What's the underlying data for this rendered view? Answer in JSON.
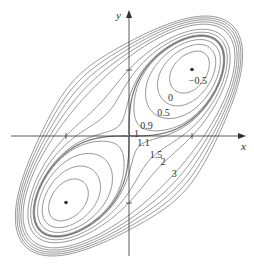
{
  "chart_data": {
    "type": "contour",
    "title": "",
    "function": "f(x,y) = x^4 + y^4 - 4xy + 1",
    "xlabel": "x",
    "ylabel": "y",
    "x_ticks": [
      {
        "value": -1,
        "label": ""
      },
      {
        "value": 1,
        "label": ""
      }
    ],
    "y_ticks": [
      {
        "value": -1,
        "label": ""
      },
      {
        "value": 1,
        "label": ""
      }
    ],
    "xlim": [
      -1.85,
      1.85
    ],
    "ylim": [
      -1.85,
      1.85
    ],
    "grid": false,
    "contour_levels": [
      -0.5,
      0,
      0.5,
      0.9,
      1,
      1.1,
      1.5,
      2,
      3
    ],
    "extra_unlabeled_levels": [
      3.5,
      4,
      4.5,
      5
    ],
    "level_labels": [
      {
        "text": "−0.5",
        "x": 0.95,
        "y": 0.78
      },
      {
        "text": "0",
        "x": 0.62,
        "y": 0.53
      },
      {
        "text": "0.5",
        "x": 0.45,
        "y": 0.3
      },
      {
        "text": "0.9",
        "x": 0.18,
        "y": 0.1
      },
      {
        "text": "1",
        "x": 0.08,
        "y": -0.02
      },
      {
        "text": "1.1",
        "x": 0.13,
        "y": -0.15
      },
      {
        "text": "1.5",
        "x": 0.33,
        "y": -0.33
      },
      {
        "text": "2",
        "x": 0.5,
        "y": -0.44
      },
      {
        "text": "3",
        "x": 0.68,
        "y": -0.62
      }
    ],
    "critical_points": [
      {
        "x": 1,
        "y": 1,
        "type": "local minimum",
        "value": -1
      },
      {
        "x": -1,
        "y": -1,
        "type": "local minimum",
        "value": -1
      },
      {
        "x": 0,
        "y": 0,
        "type": "saddle point",
        "value": 1
      }
    ]
  },
  "colors": {
    "contour": "#777777",
    "axis": "#333333",
    "point": "#333333"
  },
  "axes": {
    "x_label": "x",
    "y_label": "y"
  }
}
